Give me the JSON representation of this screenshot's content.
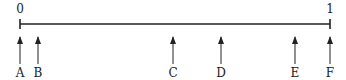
{
  "diagram": {
    "type": "number-line",
    "colors": {
      "ink": "#222222",
      "background": "#ffffff"
    },
    "line": {
      "x_start": 20,
      "x_end": 330,
      "y": 24
    },
    "endpoints": [
      {
        "label": "0",
        "value": 0,
        "x": 20
      },
      {
        "label": "1",
        "value": 1,
        "x": 330
      }
    ],
    "arrows": [
      {
        "label": "A",
        "x": 20
      },
      {
        "label": "B",
        "x": 38
      },
      {
        "label": "C",
        "x": 173
      },
      {
        "label": "D",
        "x": 221
      },
      {
        "label": "E",
        "x": 295
      },
      {
        "label": "F",
        "x": 330
      }
    ]
  }
}
